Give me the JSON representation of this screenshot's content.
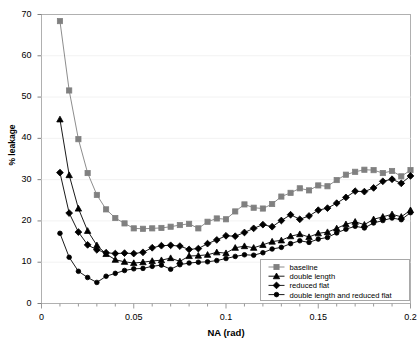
{
  "chart_data": {
    "type": "line",
    "title": "",
    "xlabel": "NA (rad)",
    "ylabel": "% leakage",
    "xlim": [
      0,
      0.2
    ],
    "ylim": [
      0,
      70
    ],
    "xticks": [
      "0",
      "0.05",
      "0.1",
      "0.15",
      "0.2"
    ],
    "xtick_values": [
      0,
      0.05,
      0.1,
      0.15,
      0.2
    ],
    "yticks": [
      "0",
      "10",
      "20",
      "30",
      "40",
      "50",
      "60",
      "70"
    ],
    "ytick_values": [
      0,
      10,
      20,
      30,
      40,
      50,
      60,
      70
    ],
    "grid": false,
    "minor_xtick_step": 0.01,
    "legend_position": "bottom-right",
    "x": [
      0.01,
      0.015,
      0.02,
      0.025,
      0.03,
      0.035,
      0.04,
      0.045,
      0.05,
      0.055,
      0.06,
      0.065,
      0.07,
      0.075,
      0.08,
      0.085,
      0.09,
      0.095,
      0.1,
      0.105,
      0.11,
      0.115,
      0.12,
      0.125,
      0.13,
      0.135,
      0.14,
      0.145,
      0.15,
      0.155,
      0.16,
      0.165,
      0.17,
      0.175,
      0.18,
      0.185,
      0.19,
      0.195,
      0.2
    ],
    "series": [
      {
        "name": "baseline",
        "marker": "square",
        "color": "#808080",
        "values": [
          68.4,
          51.6,
          39.8,
          31.6,
          26.3,
          22.8,
          20.7,
          19.4,
          18.2,
          18.1,
          18.2,
          18.3,
          18.6,
          19.0,
          19.3,
          18.2,
          19.8,
          20.6,
          20.4,
          22.3,
          24.0,
          23.2,
          23.0,
          24.1,
          25.9,
          26.8,
          27.9,
          27.4,
          28.6,
          28.4,
          29.9,
          31.2,
          31.9,
          32.4,
          32.3,
          31.6,
          32.1,
          30.8,
          32.3
        ]
      },
      {
        "name": "double length",
        "marker": "triangle",
        "color": "#000000",
        "values": [
          44.6,
          31.1,
          23.0,
          17.6,
          14.1,
          12.0,
          10.6,
          10.1,
          9.8,
          10.0,
          10.3,
          10.5,
          11.0,
          10.2,
          11.5,
          11.6,
          11.8,
          12.4,
          12.2,
          13.5,
          13.9,
          13.5,
          14.2,
          15.0,
          15.3,
          16.3,
          16.8,
          16.1,
          17.0,
          17.3,
          18.2,
          19.2,
          19.8,
          19.1,
          20.4,
          21.0,
          21.6,
          21.0,
          22.6
        ]
      },
      {
        "name": "reduced flat",
        "marker": "diamond",
        "color": "#000000",
        "values": [
          31.7,
          21.9,
          17.3,
          14.2,
          13.0,
          12.3,
          12.1,
          12.2,
          12.1,
          12.4,
          13.5,
          14.0,
          14.1,
          13.9,
          13.1,
          13.3,
          14.5,
          15.4,
          16.4,
          16.3,
          17.2,
          18.2,
          19.1,
          18.6,
          20.1,
          21.5,
          20.4,
          21.2,
          22.6,
          23.1,
          24.3,
          25.7,
          27.2,
          27.1,
          28.0,
          29.6,
          30.1,
          29.1,
          30.9
        ]
      },
      {
        "name": "double length and reduced flat",
        "marker": "circle",
        "color": "#000000",
        "values": [
          17.0,
          11.2,
          7.8,
          6.3,
          5.1,
          6.6,
          7.3,
          8.0,
          8.4,
          8.5,
          9.0,
          9.3,
          8.3,
          9.4,
          9.8,
          10.0,
          10.1,
          10.4,
          10.9,
          11.4,
          11.8,
          11.7,
          12.3,
          13.2,
          13.6,
          14.5,
          15.2,
          14.8,
          15.6,
          16.0,
          17.1,
          18.0,
          18.7,
          18.3,
          19.5,
          20.1,
          20.7,
          20.3,
          22.0
        ]
      }
    ]
  },
  "legend": {
    "entries": [
      {
        "label": "baseline"
      },
      {
        "label": "double length"
      },
      {
        "label": "reduced flat"
      },
      {
        "label": "double length and reduced flat"
      }
    ]
  }
}
